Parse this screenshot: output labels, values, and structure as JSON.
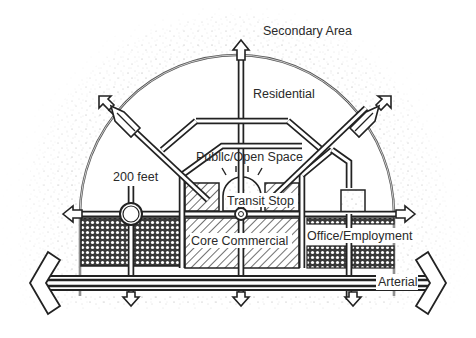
{
  "diagram": {
    "title": "",
    "labels": {
      "secondary_area": "Secondary Area",
      "residential": "Residential",
      "public_open_space": "Publlc/Open Space",
      "feet_200": "200 feet",
      "transit_stop": "Transit Stop",
      "core_commercial": "Core Commercial",
      "office_employment": "Office/Employment",
      "arterial": "Arterial"
    },
    "zones": [
      {
        "name": "Secondary Area",
        "pattern": "stipple",
        "position": "outer ring"
      },
      {
        "name": "Residential",
        "pattern": "white",
        "position": "inside semicircle"
      },
      {
        "name": "Public/Open Space",
        "pattern": "white",
        "position": "center"
      },
      {
        "name": "Transit Stop",
        "pattern": "stipple",
        "position": "center dome"
      },
      {
        "name": "Core Commercial",
        "pattern": "diagonal hatch",
        "position": "center bottom"
      },
      {
        "name": "Office/Employment",
        "pattern": "crosshatch",
        "position": "left and right bottom"
      }
    ],
    "colors": {
      "ink": "#222222",
      "background": "#ffffff",
      "stipple": "#9a9a9a"
    }
  }
}
